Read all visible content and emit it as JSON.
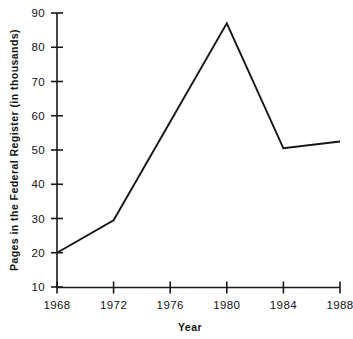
{
  "chart_data": {
    "type": "line",
    "title": "",
    "xlabel": "Year",
    "ylabel": "Pages in the Federal Register (in thousands)",
    "x": [
      1968,
      1972,
      1976,
      1980,
      1984,
      1988
    ],
    "xtick_labels": [
      "1968",
      "1972",
      "1976",
      "1980",
      "1984",
      "1988"
    ],
    "values": [
      20,
      29.5,
      61,
      87,
      50.5,
      52.5
    ],
    "vertices": [
      {
        "x": 1968,
        "y": 20
      },
      {
        "x": 1972,
        "y": 29.5
      },
      {
        "x": 1980,
        "y": 87
      },
      {
        "x": 1984,
        "y": 50.5
      },
      {
        "x": 1988,
        "y": 52.5
      }
    ],
    "ylim": [
      10,
      90
    ],
    "xlim": [
      1968,
      1988
    ],
    "ytick_values": [
      10,
      20,
      30,
      40,
      50,
      60,
      70,
      80,
      90
    ],
    "ytick_labels": [
      "10",
      "20",
      "30",
      "40",
      "50",
      "60",
      "70",
      "80",
      "90"
    ],
    "grid": false,
    "legend": null,
    "series_color": "#151515",
    "axis_color": "#1a1a1a",
    "background_color": "#ffffff"
  }
}
